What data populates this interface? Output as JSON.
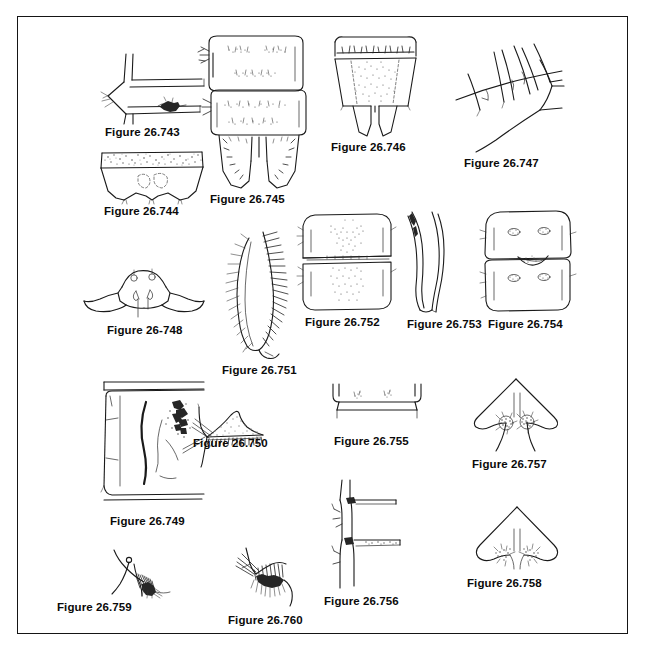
{
  "plate": {
    "title": "Insect morphology figure plate 26.743-26.760",
    "border_color": "#151515",
    "background_color": "#ffffff",
    "label_color": "#0a0a0a",
    "ink_color": "#1a1a1a"
  },
  "figures": [
    {
      "id": "fig-26-743",
      "label": "Figure 26.743",
      "label_x": 105,
      "label_y": 126,
      "art_x": 100,
      "art_y": 52,
      "art_w": 108,
      "art_h": 72,
      "subject": "lateral abdominal segment with dark sclerotized patch"
    },
    {
      "id": "fig-26-744",
      "label": "Figure 26.744",
      "label_x": 104,
      "label_y": 205,
      "art_x": 96,
      "art_y": 148,
      "art_w": 112,
      "art_h": 56,
      "subject": "trapezoidal tergite with dense stippled fringe and paired lobes"
    },
    {
      "id": "fig-26-745",
      "label": "Figure 26.745",
      "label_x": 210,
      "label_y": 195,
      "art_x": 195,
      "art_y": 33,
      "art_w": 116,
      "art_h": 158,
      "subject": "two abdominal segments above bilobed anal segment"
    },
    {
      "id": "fig-26-746",
      "label": "Figure 26.746",
      "label_x": 331,
      "label_y": 141,
      "art_x": 325,
      "art_y": 34,
      "art_w": 100,
      "art_h": 104,
      "subject": "tergite with stippled median field and two apical lobes"
    },
    {
      "id": "fig-26-747",
      "label": "Figure 26.747",
      "label_x": 464,
      "label_y": 157,
      "art_x": 452,
      "art_y": 38,
      "art_w": 112,
      "art_h": 116,
      "subject": "sparse long setae on membranous surface"
    },
    {
      "id": "fig-26-748",
      "label": "Figure 26-748",
      "label_x": 107,
      "label_y": 324,
      "art_x": 82,
      "art_y": 265,
      "art_w": 124,
      "art_h": 56,
      "subject": "hypopygium with paired hooked gonostyli and tubercles"
    },
    {
      "id": "fig-26-749",
      "label": "Figure 26.749",
      "label_x": 110,
      "label_y": 515,
      "art_x": 100,
      "art_y": 380,
      "art_w": 106,
      "art_h": 132,
      "subject": "large lateral segment with dark streak and dark tuft"
    },
    {
      "id": "fig-26-750",
      "label": "Figure 26.750",
      "label_x": 193,
      "label_y": 437,
      "art_x": 181,
      "art_y": 405,
      "art_w": 100,
      "art_h": 62,
      "subject": "stippled lobe with comb of spines"
    },
    {
      "id": "fig-26-751",
      "label": "Figure 26.751",
      "label_x": 222,
      "label_y": 364,
      "art_x": 225,
      "art_y": 230,
      "art_w": 72,
      "art_h": 130,
      "subject": "plumose fringed lobe with dense long setae"
    },
    {
      "id": "fig-26-752",
      "label": "Figure 26.752",
      "label_x": 305,
      "label_y": 318,
      "art_x": 297,
      "art_y": 212,
      "art_w": 100,
      "art_h": 102,
      "subject": "two stacked tergites with stippled median markings"
    },
    {
      "id": "fig-26-753",
      "label": "Figure 26.753",
      "label_x": 407,
      "label_y": 318,
      "art_x": 406,
      "art_y": 210,
      "art_w": 50,
      "art_h": 104,
      "subject": "pair of slender curved sickle-shaped claspers"
    },
    {
      "id": "fig-26-754",
      "label": "Figure 26.754",
      "label_x": 488,
      "label_y": 318,
      "art_x": 478,
      "art_y": 208,
      "art_w": 100,
      "art_h": 106,
      "subject": "two stacked segments with paired oval stippled spots"
    },
    {
      "id": "fig-26-755",
      "label": "Figure 26.755",
      "label_x": 334,
      "label_y": 435,
      "art_x": 327,
      "art_y": 382,
      "art_w": 100,
      "art_h": 48,
      "subject": "narrow transverse band with small stippled marks"
    },
    {
      "id": "fig-26-756",
      "label": "Figure 26.756",
      "label_x": 324,
      "label_y": 595,
      "art_x": 330,
      "art_y": 478,
      "art_w": 84,
      "art_h": 112,
      "subject": "longitudinal ridge with two dark lateral attachments"
    },
    {
      "id": "fig-26-757",
      "label": "Figure 26.757",
      "label_x": 472,
      "label_y": 458,
      "art_x": 466,
      "art_y": 377,
      "art_w": 100,
      "art_h": 76,
      "subject": "triangular plate with paired rosette tubercles"
    },
    {
      "id": "fig-26-758",
      "label": "Figure 26.758",
      "label_x": 467,
      "label_y": 577,
      "art_x": 470,
      "art_y": 505,
      "art_w": 94,
      "art_h": 68,
      "subject": "cordate plate with paired stippled setal patches"
    },
    {
      "id": "fig-26-759",
      "label": "Figure 26.759",
      "label_x": 57,
      "label_y": 601,
      "art_x": 108,
      "art_y": 548,
      "art_w": 80,
      "art_h": 50,
      "subject": "curved seta with knob and dense apical brush"
    },
    {
      "id": "fig-26-760",
      "label": "Figure 26.760",
      "label_x": 228,
      "label_y": 614,
      "art_x": 228,
      "art_y": 546,
      "art_w": 86,
      "art_h": 62,
      "subject": "comb row with dark dense pecten teeth"
    }
  ]
}
